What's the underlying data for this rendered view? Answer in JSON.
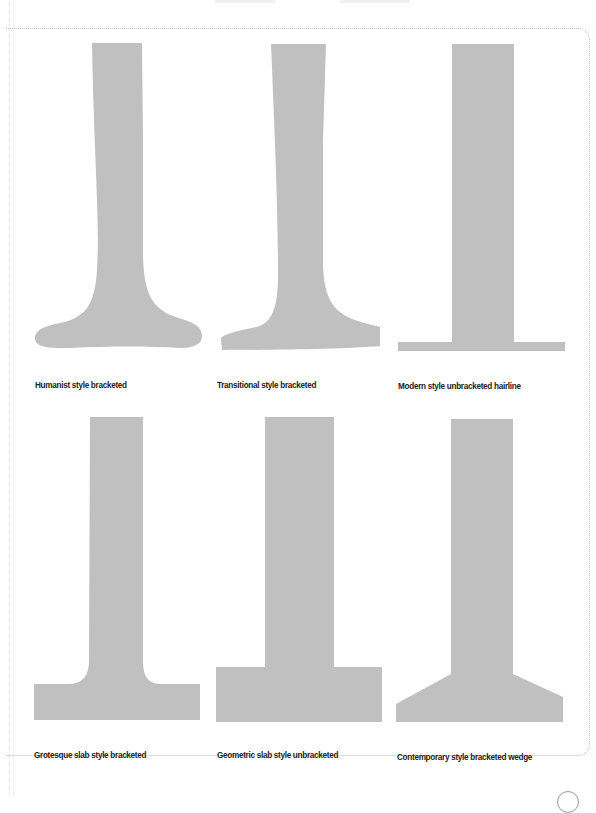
{
  "figure": {
    "shape_color": "#c0c0c0",
    "frame_color": "#bdbdbd",
    "items": [
      {
        "label": "Humanist style bracketed",
        "style": "humanist"
      },
      {
        "label": "Transitional style bracketed",
        "style": "transitional"
      },
      {
        "label": "Modern style unbracketed hairline",
        "style": "modern"
      },
      {
        "label": "Grotesque slab style bracketed",
        "style": "grotesque"
      },
      {
        "label": "Geometric slab style unbracketed",
        "style": "geometric"
      },
      {
        "label": "Contemporary style bracketed wedge",
        "style": "contemporary"
      }
    ]
  }
}
